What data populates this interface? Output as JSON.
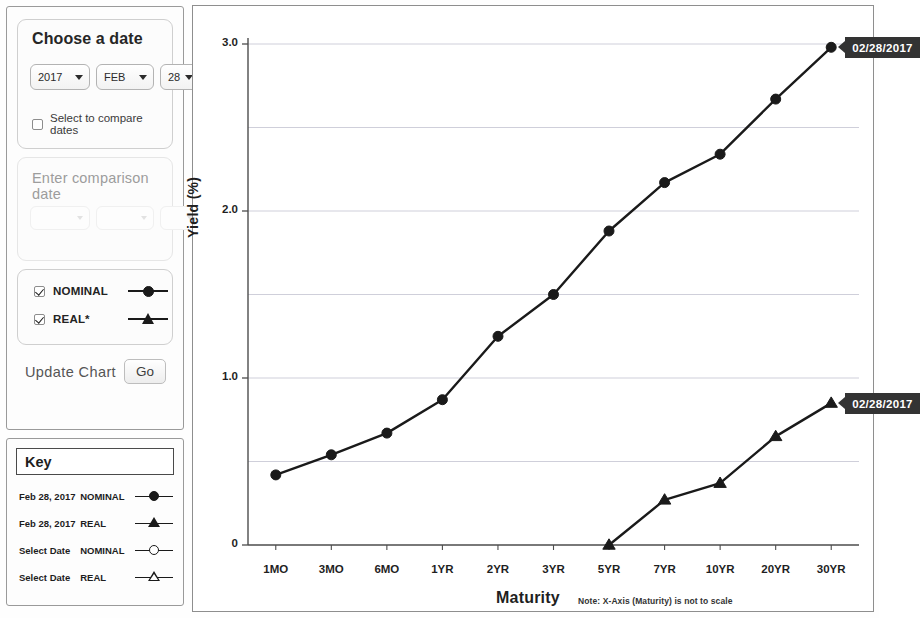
{
  "controls": {
    "choose_title": "Choose a date",
    "year": "2017",
    "month": "FEB",
    "day": "28",
    "compare_checkbox_label": "Select to compare dates",
    "comparison_title": "Enter comparison date",
    "comparison_year": "",
    "comparison_month": "",
    "comparison_day": "",
    "series": [
      {
        "label": "NOMINAL",
        "marker": "filled-circle",
        "checked": true
      },
      {
        "label": "REAL*",
        "marker": "filled-triangle",
        "checked": true
      }
    ],
    "update_label": "Update Chart",
    "go_label": "Go"
  },
  "key": {
    "title": "Key",
    "rows": [
      {
        "date": "Feb 28, 2017",
        "type": "NOMINAL",
        "marker": "filled-circle"
      },
      {
        "date": "Feb 28, 2017",
        "type": "REAL",
        "marker": "filled-triangle"
      },
      {
        "date": "Select Date",
        "type": "NOMINAL",
        "marker": "hollow-circle"
      },
      {
        "date": "Select Date",
        "type": "REAL",
        "marker": "hollow-triangle"
      }
    ]
  },
  "chart_data": {
    "type": "line",
    "title": "",
    "xlabel": "Maturity",
    "ylabel": "Yield (%)",
    "note": "Note: X-Axis (Maturity) is not to scale",
    "categories": [
      "1MO",
      "3MO",
      "6MO",
      "1YR",
      "2YR",
      "3YR",
      "5YR",
      "7YR",
      "10YR",
      "20YR",
      "30YR"
    ],
    "ylim": [
      0,
      3.0
    ],
    "yticks": [
      0,
      1.0,
      2.0,
      3.0
    ],
    "ytick_labels": [
      "0",
      "1.0",
      "2.0",
      "3.0"
    ],
    "minor_gridlines": [
      0.5,
      1.5,
      2.5
    ],
    "grid": true,
    "legend_position": "external-left",
    "series": [
      {
        "name": "NOMINAL",
        "marker": "filled-circle",
        "values": [
          0.42,
          0.54,
          0.67,
          0.87,
          1.25,
          1.5,
          1.88,
          2.17,
          2.34,
          2.67,
          2.98
        ]
      },
      {
        "name": "REAL",
        "marker": "filled-triangle",
        "values": [
          null,
          null,
          null,
          null,
          null,
          null,
          0.0,
          0.27,
          0.37,
          0.65,
          0.85
        ]
      }
    ],
    "annotations": [
      {
        "text": "02/28/2017",
        "series": "NOMINAL",
        "at": "30YR"
      },
      {
        "text": "02/28/2017",
        "series": "REAL",
        "at": "30YR"
      }
    ],
    "colors": {
      "line": "#1a1a1a",
      "grid": "#c9c9d6",
      "axis": "#555555",
      "callout_bg": "#333333"
    }
  }
}
